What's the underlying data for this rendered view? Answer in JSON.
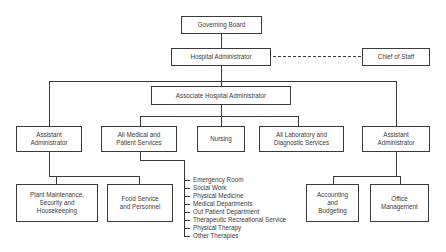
{
  "chart": {
    "nodes": {
      "governing_board": "Governing Board",
      "hospital_administrator": "Hospital Administrator",
      "chief_of_staff": "Chief of Staff",
      "associate_hospital_administrator": "Associate Hospital Administrator",
      "assistant_administrator_left": "Assistant\nAdministrator",
      "all_medical": "All Medical and\nPatient Services",
      "nursing": "Nursing",
      "all_laboratory": "All Laboratory and\nDiagnostic Services",
      "assistant_administrator_right": "Assistant\nAdministrator",
      "plant_maintenance": "Plant Maintenance,\nSecurity and\nHousekeeping",
      "food_service": "Food Service\nand Personnel",
      "accounting": "Accounting\nand\nBudgeting",
      "office_management": "Office\nManagement"
    },
    "medical_services_list": [
      "Emergency Room",
      "Social Work",
      "Physical Medicine",
      "Medical Departments",
      "Out Patient Department",
      "Therapeutic Recreational Service",
      "Physical Therapy",
      "Other Therapies"
    ],
    "relations": [
      {
        "from": "Governing Board",
        "to": "Hospital Administrator",
        "style": "solid"
      },
      {
        "from": "Hospital Administrator",
        "to": "Chief of Staff",
        "style": "dashed"
      },
      {
        "from": "Hospital Administrator",
        "to": "Associate Hospital Administrator",
        "style": "solid"
      },
      {
        "from": "Hospital Administrator",
        "to": "Assistant Administrator (left)",
        "style": "solid"
      },
      {
        "from": "Hospital Administrator",
        "to": "Assistant Administrator (right)",
        "style": "solid"
      },
      {
        "from": "Associate Hospital Administrator",
        "to": "All Medical and Patient Services",
        "style": "solid"
      },
      {
        "from": "Associate Hospital Administrator",
        "to": "Nursing",
        "style": "solid"
      },
      {
        "from": "Associate Hospital Administrator",
        "to": "All Laboratory and Diagnostic Services",
        "style": "solid"
      },
      {
        "from": "Assistant Administrator (left)",
        "to": "Plant Maintenance, Security and Housekeeping",
        "style": "solid"
      },
      {
        "from": "Assistant Administrator (left)",
        "to": "Food Service and Personnel",
        "style": "solid"
      },
      {
        "from": "Assistant Administrator (right)",
        "to": "Accounting and Budgeting",
        "style": "solid"
      },
      {
        "from": "Assistant Administrator (right)",
        "to": "Office Management",
        "style": "solid"
      }
    ],
    "colors": {
      "line": "#3a3a3a",
      "background": "#ffffff"
    }
  }
}
